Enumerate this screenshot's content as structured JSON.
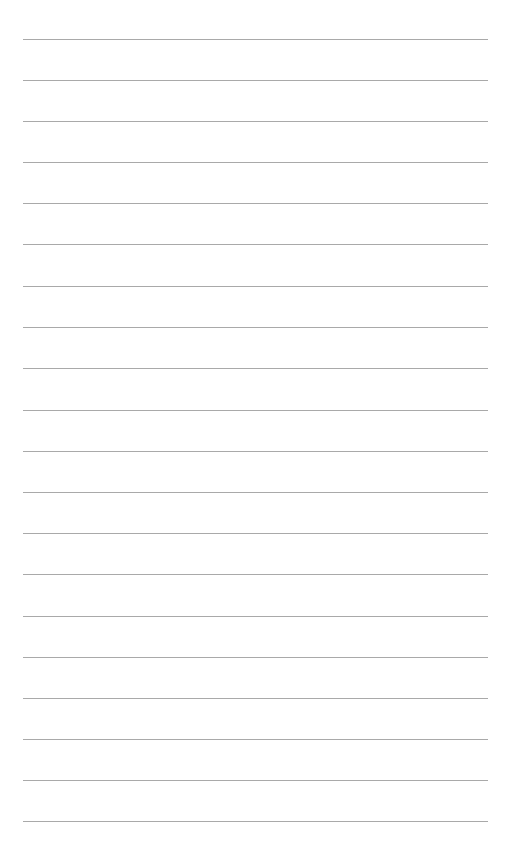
{
  "page": {
    "type": "lined-paper",
    "background_color": "#ffffff",
    "rule_color": "#9a9a9a",
    "rule_left": 23,
    "rule_right": 488,
    "rule_count": 20,
    "rule_y": [
      39,
      80,
      121,
      162,
      203,
      244,
      286,
      327,
      368,
      410,
      451,
      492,
      533,
      574,
      616,
      657,
      698,
      739,
      780,
      821
    ]
  }
}
